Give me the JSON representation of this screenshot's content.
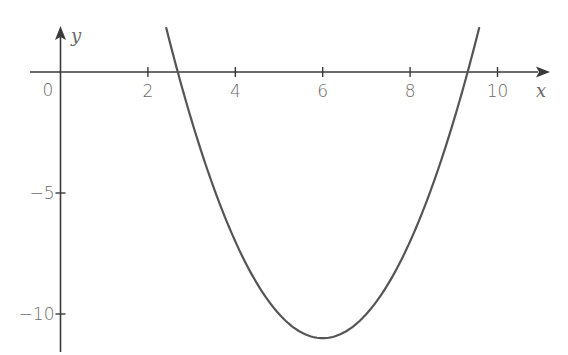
{
  "chart_data": {
    "type": "line",
    "title": "",
    "xlabel": "x",
    "ylabel": "y",
    "function": "y = (x - 6)^2 - 11",
    "xlim": [
      -0.6,
      11.5
    ],
    "ylim": [
      -11.8,
      1.8
    ],
    "grid": false,
    "legend": null,
    "x_ticks": [
      2,
      4,
      6,
      8,
      10
    ],
    "x_tick_labels": [
      "2",
      "4",
      "6",
      "8",
      "10"
    ],
    "y_ticks": [
      -5,
      -10
    ],
    "y_tick_labels": [
      "−5",
      "−10"
    ],
    "origin_label": "0",
    "series": [
      {
        "name": "parabola",
        "color": "#555555",
        "x": [
          2.42,
          2.68,
          3.0,
          3.5,
          4.0,
          4.5,
          5.0,
          5.5,
          6.0,
          6.5,
          7.0,
          7.5,
          8.0,
          8.5,
          9.0,
          9.32,
          9.58
        ],
        "y": [
          1.82,
          0.0,
          -2.0,
          -4.75,
          -7.0,
          -8.75,
          -10.0,
          -10.75,
          -11.0,
          -10.75,
          -10.0,
          -8.75,
          -7.0,
          -4.75,
          -2.0,
          0.0,
          1.82
        ]
      }
    ],
    "key_points": {
      "vertex": [
        6,
        -11
      ],
      "roots": [
        2.68,
        9.32
      ]
    },
    "colors": {
      "axis": "#3a3a3a",
      "curve": "#555555",
      "text": "#6a6a6a"
    }
  }
}
